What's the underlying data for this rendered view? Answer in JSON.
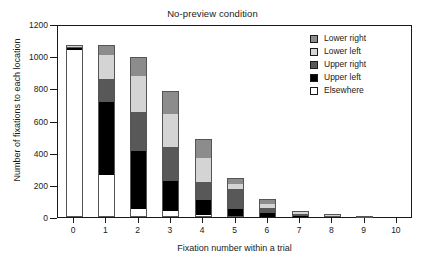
{
  "chart_data": {
    "type": "bar",
    "title": "No-preview condition",
    "xlabel": "Fixation number within a trial",
    "ylabel": "Number of fixations to each location",
    "stacked": true,
    "grid": false,
    "legend_position": "top-right",
    "categories": [
      "0",
      "1",
      "2",
      "3",
      "4",
      "5",
      "6",
      "7",
      "8",
      "9",
      "10"
    ],
    "xlim": [
      -0.5,
      10.5
    ],
    "ylim": [
      0,
      1200
    ],
    "yticks": [
      0,
      200,
      400,
      600,
      800,
      1000,
      1200
    ],
    "ytick_labels": [
      "0",
      "200",
      "400",
      "600",
      "800",
      "1000",
      "1200"
    ],
    "xticks": [
      "0",
      "1",
      "2",
      "3",
      "4",
      "5",
      "6",
      "7",
      "8",
      "9",
      "10"
    ],
    "series": [
      {
        "name": "Elsewhere",
        "color": "#ffffff",
        "values": [
          1040,
          260,
          50,
          35,
          13,
          5,
          2,
          0,
          0,
          0,
          0
        ]
      },
      {
        "name": "Upper left",
        "color": "#000000",
        "values": [
          8,
          455,
          360,
          190,
          90,
          45,
          23,
          8,
          5,
          1,
          0
        ]
      },
      {
        "name": "Upper right",
        "color": "#585858",
        "values": [
          10,
          145,
          245,
          210,
          117,
          125,
          30,
          9,
          4,
          1,
          0
        ]
      },
      {
        "name": "Lower left",
        "color": "#d4d4d4",
        "values": [
          6,
          145,
          220,
          205,
          145,
          30,
          28,
          12,
          2,
          0,
          0
        ]
      },
      {
        "name": "Lower right",
        "color": "#8c8c8c",
        "values": [
          6,
          65,
          122,
          145,
          122,
          40,
          32,
          11,
          2,
          1,
          0
        ]
      }
    ],
    "totals": [
      1070,
      1070,
      997,
      785,
      487,
      245,
      115,
      40,
      13,
      3,
      0
    ]
  },
  "legend": {
    "items": [
      {
        "label": "Lower right",
        "swatch": "#8c8c8c"
      },
      {
        "label": "Lower left",
        "swatch": "#d4d4d4"
      },
      {
        "label": "Upper right",
        "swatch": "#585858"
      },
      {
        "label": "Upper left",
        "swatch": "#000000"
      },
      {
        "label": "Elsewhere",
        "swatch": "#ffffff"
      }
    ]
  }
}
